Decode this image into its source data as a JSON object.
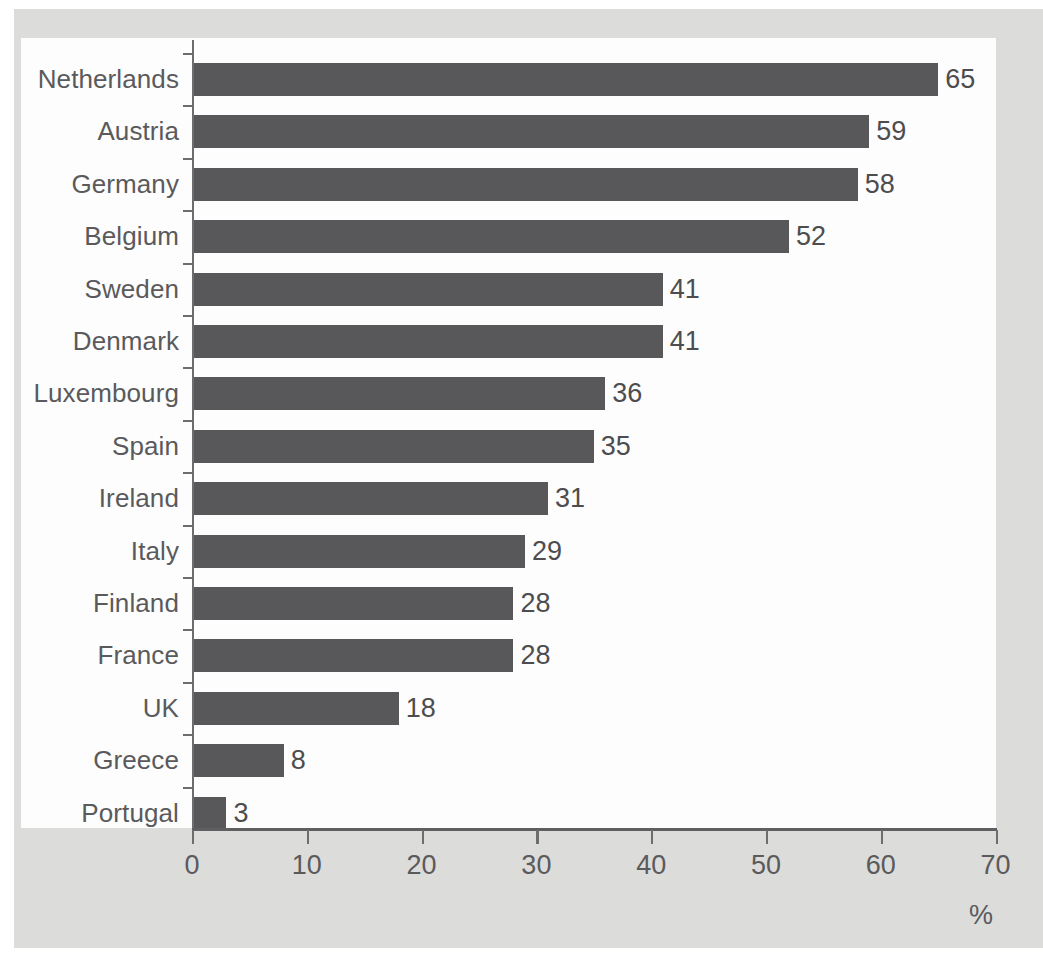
{
  "chart_data": {
    "type": "bar",
    "orientation": "horizontal",
    "title": "",
    "subtitle": "",
    "xlabel": "%",
    "ylabel": "",
    "xlim": [
      0,
      70
    ],
    "xticks": [
      0,
      10,
      20,
      30,
      40,
      50,
      60,
      70
    ],
    "xtick_labels": [
      "0",
      "10",
      "20",
      "30",
      "40",
      "50",
      "60",
      "70"
    ],
    "grid": false,
    "legend": false,
    "legend_position": "none",
    "categories": [
      "Netherlands",
      "Austria",
      "Germany",
      "Belgium",
      "Sweden",
      "Denmark",
      "Luxembourg",
      "Spain",
      "Ireland",
      "Italy",
      "Finland",
      "France",
      "UK",
      "Greece",
      "Portugal"
    ],
    "values": [
      65,
      59,
      58,
      52,
      41,
      41,
      36,
      35,
      31,
      29,
      28,
      28,
      18,
      8,
      3
    ],
    "value_labels": [
      "65",
      "59",
      "58",
      "52",
      "41",
      "41",
      "36",
      "35",
      "31",
      "29",
      "28",
      "28",
      "18",
      "8",
      "3"
    ],
    "bar_color": "#58585a",
    "plot_background": "#fdfdfd",
    "page_background": "#dcdcda",
    "axis_color": "#6d6d6f",
    "label_color": "#5a5a5c",
    "rows": [
      {
        "category": "Netherlands",
        "value": 65,
        "label": "65"
      },
      {
        "category": "Austria",
        "value": 59,
        "label": "59"
      },
      {
        "category": "Germany",
        "value": 58,
        "label": "58"
      },
      {
        "category": "Belgium",
        "value": 52,
        "label": "52"
      },
      {
        "category": "Sweden",
        "value": 41,
        "label": "41"
      },
      {
        "category": "Denmark",
        "value": 41,
        "label": "41"
      },
      {
        "category": "Luxembourg",
        "value": 36,
        "label": "36"
      },
      {
        "category": "Spain",
        "value": 35,
        "label": "35"
      },
      {
        "category": "Ireland",
        "value": 31,
        "label": "31"
      },
      {
        "category": "Italy",
        "value": 29,
        "label": "29"
      },
      {
        "category": "Finland",
        "value": 28,
        "label": "28"
      },
      {
        "category": "France",
        "value": 28,
        "label": "28"
      },
      {
        "category": "UK",
        "value": 18,
        "label": "18"
      },
      {
        "category": "Greece",
        "value": 8,
        "label": "8"
      },
      {
        "category": "Portugal",
        "value": 3,
        "label": "3"
      }
    ]
  },
  "axis": {
    "unit_label": "%"
  },
  "caption": {
    "text": ""
  }
}
